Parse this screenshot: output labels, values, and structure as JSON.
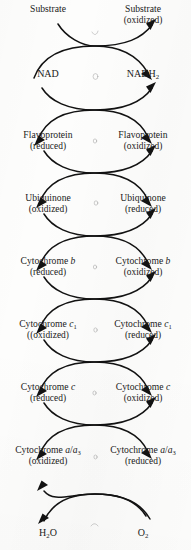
{
  "figure": {
    "kind": "electron-transport-chain-diagram",
    "background_color": "#fdfdfc",
    "ink_color": "#121212",
    "columns": [
      "reduced-donor-left",
      "oxidized-acceptor-right"
    ],
    "coupling_symbol": "crossed-curved-arrows"
  },
  "steps": [
    {
      "id": "substrate",
      "left": {
        "name": "Substrate",
        "state": ""
      },
      "right": {
        "name": "Substrate",
        "state": "(oxidized)"
      }
    },
    {
      "id": "nad",
      "left": {
        "name": "NAD",
        "state": ""
      },
      "right": {
        "name": "NADH2",
        "name_html": "NADH<sub>2</sub>",
        "state": ""
      }
    },
    {
      "id": "flavoprotein",
      "left": {
        "name": "Flavoprotein",
        "state": "(reduced)"
      },
      "right": {
        "name": "Flavoprotein",
        "state": "(oxidized)"
      }
    },
    {
      "id": "ubiquinone",
      "left": {
        "name": "Ubiquinone",
        "state": "(oxidized)"
      },
      "right": {
        "name": "Ubiquinone",
        "state": "(reduced)"
      }
    },
    {
      "id": "cytochrome-b",
      "left": {
        "name": "Cytochrome b",
        "name_html": "Cytochrome <i>b</i>",
        "state": "(reduced)"
      },
      "right": {
        "name": "Cytochrome b",
        "name_html": "Cytochrome <i>b</i>",
        "state": "(oxidized)"
      }
    },
    {
      "id": "cytochrome-c1",
      "left": {
        "name": "Cytochrome c1",
        "name_html": "Cytochrome <i>c</i><sub>1</sub>",
        "state": "((oxidized)"
      },
      "right": {
        "name": "Cytochrome c1",
        "name_html": "Cytochrome <i>c</i><sub>1</sub>",
        "state": "(reduced)"
      }
    },
    {
      "id": "cytochrome-c",
      "left": {
        "name": "Cytochrome c",
        "name_html": "Cytochrome <i>c</i>",
        "state": "(reduced)"
      },
      "right": {
        "name": "Cytochrome c",
        "name_html": "Cytochrome <i>c</i>",
        "state": "(oxidized)"
      }
    },
    {
      "id": "cytochrome-a-a3",
      "left": {
        "name": "Cytochrome a/a3",
        "name_html": "Cytochrome <i>a</i>/<i>a</i><sub>3</sub>",
        "state": "(oxidized)"
      },
      "right": {
        "name": "Cytochrome a/a3",
        "name_html": "Cytochrome <i>a</i>/<i>a</i><sub>3</sub>",
        "state": "(reduced)"
      }
    },
    {
      "id": "terminal",
      "left": {
        "name": "H2O",
        "name_html": "H<sub>2</sub>O",
        "state": ""
      },
      "right": {
        "name": "O2",
        "name_html": "O<sub>2</sub>",
        "state": ""
      }
    }
  ]
}
